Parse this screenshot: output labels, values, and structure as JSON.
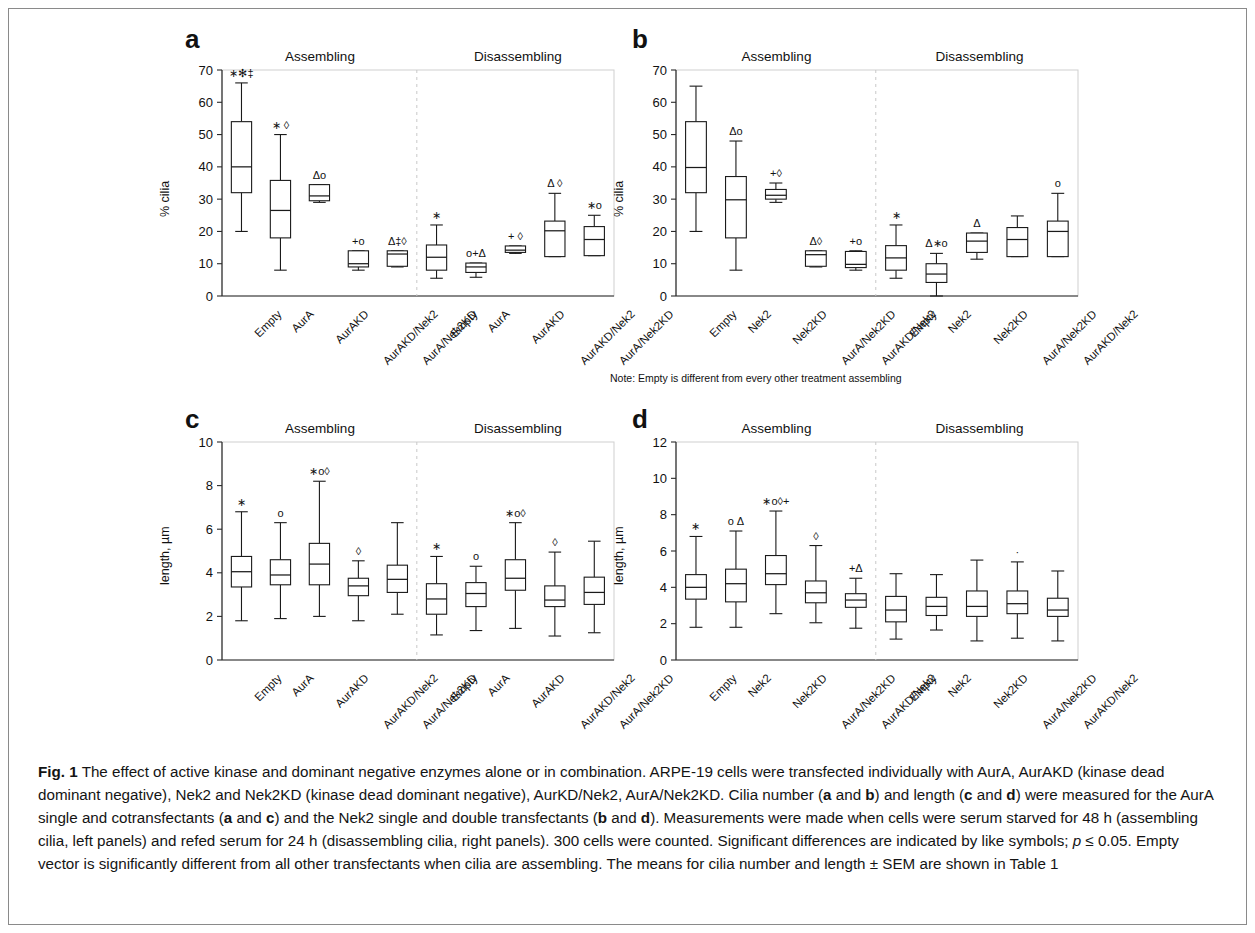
{
  "figure": {
    "label": "Fig. 1",
    "caption": "The effect of active kinase and dominant negative enzymes alone or in combination. ARPE-19 cells were transfected individually with AurA, AurAKD (kinase dead dominant negative), Nek2 and Nek2KD (kinase dead dominant negative), AurKD/Nek2, AurA/Nek2KD. Cilia number (a and b) and length (c and d) were measured for the AurA single and cotransfectants (a and c) and the Nek2 single and double transfectants (b and d). Measurements were made when cells were serum starved for 48 h (assembling cilia, left panels) and refed serum for 24 h (disassembling cilia, right panels). 300 cells were counted. Significant differences are indicated by like symbols; p ≤ 0.05. Empty vector is significantly different from all other transfectants when cilia are assembling. The means for cilia number and length ± SEM are shown in Table 1"
  },
  "note_b": "Note: Empty is different from every other treatment assembling",
  "group_titles": {
    "left": "Assembling",
    "right": "Disassembling"
  },
  "chart_data": [
    {
      "panel": "a",
      "type": "box",
      "title": "",
      "ylabel": "% cilia",
      "xlabel": "",
      "ylim": [
        0,
        70
      ],
      "yticks": [
        0,
        10,
        20,
        30,
        40,
        50,
        60,
        70
      ],
      "grid": false,
      "groups": [
        "Assembling",
        "Disassembling"
      ],
      "categories": [
        "Empty",
        "AurA",
        "AurAKD",
        "AurAKD/Nek2",
        "AurA/Nek2KD",
        "Empty",
        "AurA",
        "AurAKD",
        "AurAKD/Nek2",
        "AurA/Nek2KD"
      ],
      "boxes": [
        {
          "label": "Empty",
          "group": "Assembling",
          "whisker_low": 20.0,
          "q1": 32.0,
          "median": 40.0,
          "q3": 54.0,
          "whisker_high": 66.0,
          "symbols": "∗✻‡"
        },
        {
          "label": "AurA",
          "group": "Assembling",
          "whisker_low": 8.0,
          "q1": 18.0,
          "median": 26.5,
          "q3": 35.8,
          "whisker_high": 50.0,
          "symbols": "∗ ◊"
        },
        {
          "label": "AurAKD",
          "group": "Assembling",
          "whisker_low": 29.0,
          "q1": 29.5,
          "median": 31.0,
          "q3": 34.5,
          "whisker_high": 34.5,
          "symbols": "Δo"
        },
        {
          "label": "AurAKD/Nek2",
          "group": "Assembling",
          "whisker_low": 8.0,
          "q1": 9.0,
          "median": 10.0,
          "q3": 14.0,
          "whisker_high": 14.0,
          "symbols": "+o"
        },
        {
          "label": "AurA/Nek2KD",
          "group": "Assembling",
          "whisker_low": 9.0,
          "q1": 9.2,
          "median": 13.0,
          "q3": 14.0,
          "whisker_high": 14.0,
          "symbols": "Δ‡◊"
        },
        {
          "label": "Empty",
          "group": "Disassembling",
          "whisker_low": 5.5,
          "q1": 8.0,
          "median": 12.0,
          "q3": 15.8,
          "whisker_high": 22.0,
          "symbols": "∗"
        },
        {
          "label": "AurA",
          "group": "Disassembling",
          "whisker_low": 5.8,
          "q1": 7.3,
          "median": 9.0,
          "q3": 10.2,
          "whisker_high": 10.2,
          "symbols": "o+Δ"
        },
        {
          "label": "AurAKD",
          "group": "Disassembling",
          "whisker_low": 13.2,
          "q1": 13.5,
          "median": 14.2,
          "q3": 15.5,
          "whisker_high": 15.5,
          "symbols": "+ ◊"
        },
        {
          "label": "AurAKD/Nek2",
          "group": "Disassembling",
          "whisker_low": 12.2,
          "q1": 12.2,
          "median": 20.2,
          "q3": 23.2,
          "whisker_high": 31.8,
          "symbols": "Δ ◊"
        },
        {
          "label": "AurA/Nek2KD",
          "group": "Disassembling",
          "whisker_low": 12.5,
          "q1": 12.5,
          "median": 17.5,
          "q3": 21.5,
          "whisker_high": 25.0,
          "symbols": "∗o"
        }
      ]
    },
    {
      "panel": "b",
      "type": "box",
      "title": "",
      "ylabel": "% cilia",
      "xlabel": "",
      "ylim": [
        0,
        70
      ],
      "yticks": [
        0,
        10,
        20,
        30,
        40,
        50,
        60,
        70
      ],
      "grid": false,
      "groups": [
        "Assembling",
        "Disassembling"
      ],
      "categories": [
        "Empty",
        "Nek2",
        "Nek2KD",
        "AurA/Nek2KD",
        "AurAKD/Nek2",
        "Empty",
        "Nek2",
        "Nek2KD",
        "AurA/Nek2KD",
        "AurAKD/Nek2"
      ],
      "boxes": [
        {
          "label": "Empty",
          "group": "Assembling",
          "whisker_low": 20.0,
          "q1": 32.0,
          "median": 39.8,
          "q3": 54.0,
          "whisker_high": 65.0,
          "symbols": ""
        },
        {
          "label": "Nek2",
          "group": "Assembling",
          "whisker_low": 8.0,
          "q1": 18.0,
          "median": 29.8,
          "q3": 37.0,
          "whisker_high": 48.0,
          "symbols": "Δo"
        },
        {
          "label": "Nek2KD",
          "group": "Assembling",
          "whisker_low": 29.0,
          "q1": 30.0,
          "median": 31.2,
          "q3": 33.0,
          "whisker_high": 35.0,
          "symbols": "+◊"
        },
        {
          "label": "AurA/Nek2KD",
          "group": "Assembling",
          "whisker_low": 9.0,
          "q1": 9.2,
          "median": 12.8,
          "q3": 14.0,
          "whisker_high": 14.0,
          "symbols": "Δ◊"
        },
        {
          "label": "AurAKD/Nek2",
          "group": "Assembling",
          "whisker_low": 8.0,
          "q1": 8.8,
          "median": 9.8,
          "q3": 13.8,
          "whisker_high": 14.0,
          "symbols": "+o"
        },
        {
          "label": "Empty",
          "group": "Disassembling",
          "whisker_low": 5.5,
          "q1": 8.0,
          "median": 11.8,
          "q3": 15.6,
          "whisker_high": 22.0,
          "symbols": "∗"
        },
        {
          "label": "Nek2",
          "group": "Disassembling",
          "whisker_low": 0.0,
          "q1": 4.2,
          "median": 6.8,
          "q3": 10.0,
          "whisker_high": 13.2,
          "symbols": "Δ∗o"
        },
        {
          "label": "Nek2KD",
          "group": "Disassembling",
          "whisker_low": 11.4,
          "q1": 13.5,
          "median": 17.0,
          "q3": 19.5,
          "whisker_high": 19.5,
          "symbols": "Δ"
        },
        {
          "label": "AurA/Nek2KD",
          "group": "Disassembling",
          "whisker_low": 12.2,
          "q1": 12.2,
          "median": 17.5,
          "q3": 21.2,
          "whisker_high": 24.8,
          "symbols": ""
        },
        {
          "label": "AurAKD/Nek2",
          "group": "Disassembling",
          "whisker_low": 12.2,
          "q1": 12.2,
          "median": 20.0,
          "q3": 23.2,
          "whisker_high": 31.8,
          "symbols": "o"
        }
      ]
    },
    {
      "panel": "c",
      "type": "box",
      "title": "",
      "ylabel": "length, µm",
      "xlabel": "",
      "ylim": [
        0,
        10
      ],
      "yticks": [
        0,
        2,
        4,
        6,
        8,
        10
      ],
      "grid": false,
      "groups": [
        "Assembling",
        "Disassembling"
      ],
      "categories": [
        "Empty",
        "AurA",
        "AurAKD",
        "AurAKD/Nek2",
        "AurA/Nek2KD",
        "Empty",
        "AurA",
        "AurAKD",
        "AurAKD/Nek2",
        "AurA/Nek2KD"
      ],
      "boxes": [
        {
          "label": "Empty",
          "group": "Assembling",
          "whisker_low": 1.8,
          "q1": 3.35,
          "median": 4.05,
          "q3": 4.75,
          "whisker_high": 6.8,
          "symbols": "∗"
        },
        {
          "label": "AurA",
          "group": "Assembling",
          "whisker_low": 1.9,
          "q1": 3.45,
          "median": 3.9,
          "q3": 4.6,
          "whisker_high": 6.3,
          "symbols": "o"
        },
        {
          "label": "AurAKD",
          "group": "Assembling",
          "whisker_low": 2.0,
          "q1": 3.45,
          "median": 4.4,
          "q3": 5.35,
          "whisker_high": 8.2,
          "symbols": "∗o◊"
        },
        {
          "label": "AurAKD/Nek2",
          "group": "Assembling",
          "whisker_low": 1.8,
          "q1": 2.95,
          "median": 3.4,
          "q3": 3.75,
          "whisker_high": 4.55,
          "symbols": "◊"
        },
        {
          "label": "AurA/Nek2KD",
          "group": "Assembling",
          "whisker_low": 2.1,
          "q1": 3.1,
          "median": 3.7,
          "q3": 4.35,
          "whisker_high": 6.3,
          "symbols": ""
        },
        {
          "label": "Empty",
          "group": "Disassembling",
          "whisker_low": 1.15,
          "q1": 2.1,
          "median": 2.8,
          "q3": 3.5,
          "whisker_high": 4.75,
          "symbols": "∗"
        },
        {
          "label": "AurA",
          "group": "Disassembling",
          "whisker_low": 1.35,
          "q1": 2.45,
          "median": 3.05,
          "q3": 3.55,
          "whisker_high": 4.3,
          "symbols": "o"
        },
        {
          "label": "AurAKD",
          "group": "Disassembling",
          "whisker_low": 1.45,
          "q1": 3.2,
          "median": 3.75,
          "q3": 4.6,
          "whisker_high": 6.3,
          "symbols": "∗o◊"
        },
        {
          "label": "AurAKD/Nek2",
          "group": "Disassembling",
          "whisker_low": 1.1,
          "q1": 2.45,
          "median": 2.75,
          "q3": 3.4,
          "whisker_high": 4.95,
          "symbols": "◊"
        },
        {
          "label": "AurA/Nek2KD",
          "group": "Disassembling",
          "whisker_low": 1.25,
          "q1": 2.55,
          "median": 3.1,
          "q3": 3.8,
          "whisker_high": 5.45,
          "symbols": ""
        }
      ]
    },
    {
      "panel": "d",
      "type": "box",
      "title": "",
      "ylabel": "length, µm",
      "xlabel": "",
      "ylim": [
        0,
        12
      ],
      "yticks": [
        0,
        2,
        4,
        6,
        8,
        10,
        12
      ],
      "grid": false,
      "groups": [
        "Assembling",
        "Disassembling"
      ],
      "categories": [
        "Empty",
        "Nek2",
        "Nek2KD",
        "AurA/Nek2KD",
        "AurAKD/Nek2",
        "Empty",
        "Nek2",
        "Nek2KD",
        "AurA/Nek2KD",
        "AurAKD/Nek2"
      ],
      "boxes": [
        {
          "label": "Empty",
          "group": "Assembling",
          "whisker_low": 1.8,
          "q1": 3.35,
          "median": 4.0,
          "q3": 4.7,
          "whisker_high": 6.8,
          "symbols": "∗"
        },
        {
          "label": "Nek2",
          "group": "Assembling",
          "whisker_low": 1.8,
          "q1": 3.2,
          "median": 4.2,
          "q3": 5.0,
          "whisker_high": 7.1,
          "symbols": "o Δ"
        },
        {
          "label": "Nek2KD",
          "group": "Assembling",
          "whisker_low": 2.55,
          "q1": 4.15,
          "median": 4.75,
          "q3": 5.75,
          "whisker_high": 8.2,
          "symbols": "∗o◊+"
        },
        {
          "label": "AurA/Nek2KD",
          "group": "Assembling",
          "whisker_low": 2.05,
          "q1": 3.15,
          "median": 3.7,
          "q3": 4.35,
          "whisker_high": 6.3,
          "symbols": "◊"
        },
        {
          "label": "AurAKD/Nek2",
          "group": "Assembling",
          "whisker_low": 1.75,
          "q1": 2.9,
          "median": 3.3,
          "q3": 3.65,
          "whisker_high": 4.5,
          "symbols": "+Δ"
        },
        {
          "label": "Empty",
          "group": "Disassembling",
          "whisker_low": 1.15,
          "q1": 2.1,
          "median": 2.75,
          "q3": 3.5,
          "whisker_high": 4.75,
          "symbols": ""
        },
        {
          "label": "Nek2",
          "group": "Disassembling",
          "whisker_low": 1.65,
          "q1": 2.45,
          "median": 2.95,
          "q3": 3.45,
          "whisker_high": 4.7,
          "symbols": ""
        },
        {
          "label": "Nek2KD",
          "group": "Disassembling",
          "whisker_low": 1.05,
          "q1": 2.4,
          "median": 2.95,
          "q3": 3.8,
          "whisker_high": 5.5,
          "symbols": ""
        },
        {
          "label": "AurA/Nek2KD",
          "group": "Disassembling",
          "whisker_low": 1.2,
          "q1": 2.55,
          "median": 3.1,
          "q3": 3.8,
          "whisker_high": 5.4,
          "symbols": "·"
        },
        {
          "label": "AurAKD/Nek2",
          "group": "Disassembling",
          "whisker_low": 1.05,
          "q1": 2.4,
          "median": 2.75,
          "q3": 3.4,
          "whisker_high": 4.9,
          "symbols": ""
        }
      ]
    }
  ]
}
